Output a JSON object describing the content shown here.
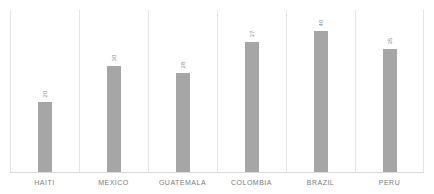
{
  "chart_data": {
    "type": "bar",
    "title": "",
    "subtitle": "",
    "xlabel": "",
    "ylabel": "",
    "categories": [
      "HAITI",
      "MEXICO",
      "GUATEMALA",
      "COLOMBIA",
      "BRAZIL",
      "PERU"
    ],
    "values": [
      20,
      30,
      28,
      37,
      40,
      35
    ],
    "value_labels": [
      "20",
      "30",
      "28",
      "37",
      "40",
      "35"
    ],
    "ylim": [
      0,
      46
    ],
    "grid": false,
    "category_separators": true,
    "legend": null,
    "legend_position": "none",
    "annotations": [],
    "series": [
      {
        "name": "",
        "values": [
          20,
          30,
          28,
          37,
          40,
          35
        ]
      }
    ]
  },
  "style": {
    "bar_color": "#a6a6a6",
    "separator_color": "#e4e4e4",
    "baseline_color": "#d9d9d9",
    "label_color": "#7a7a7a",
    "value_label_color": "#8c8c8c",
    "background": "#ffffff"
  }
}
